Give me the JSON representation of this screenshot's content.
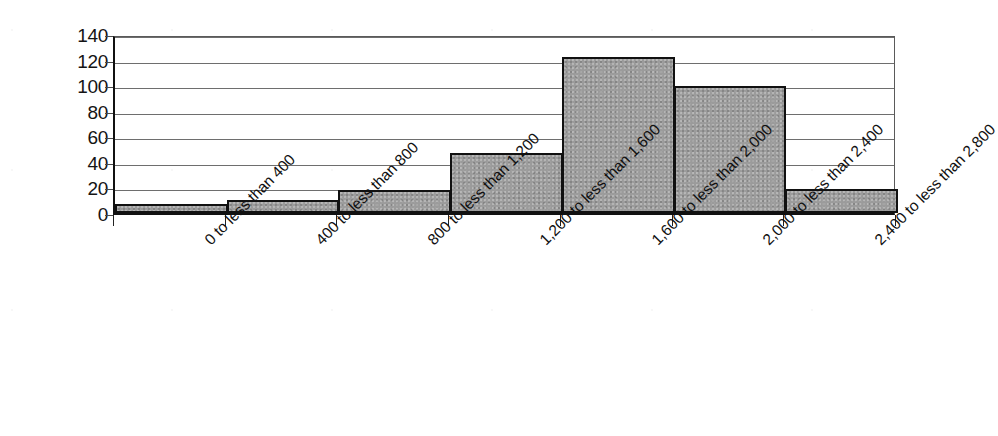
{
  "chart_data": {
    "type": "bar",
    "title": "",
    "subtitle": "",
    "xlabel": "",
    "ylabel": "",
    "categories": [
      "0 to less than 400",
      "400 to less than 800",
      "800 to less than 1,200",
      "1,200 to less than 1,600",
      "1,600 to less than 2,000",
      "2,000 to less than 2,400",
      "2,400 to less than 2,800"
    ],
    "values": [
      7,
      10,
      18,
      47,
      122,
      99,
      19
    ],
    "ylim": [
      0,
      140
    ],
    "y_ticks": [
      0,
      20,
      40,
      60,
      80,
      100,
      120,
      140
    ],
    "y_tick_labels": [
      "0",
      "20",
      "40",
      "60",
      "80",
      "100",
      "120",
      "140"
    ],
    "grid": true,
    "legend": false,
    "legend_position": "none",
    "bar_fill_color": "#9b9b9b",
    "bar_border_color": "#111111",
    "gridline_color": "#6e6e6e",
    "axis_color": "#111111",
    "background_color": "#ffffff",
    "x_tick_label_rotation": -45,
    "bars_touching": true
  }
}
